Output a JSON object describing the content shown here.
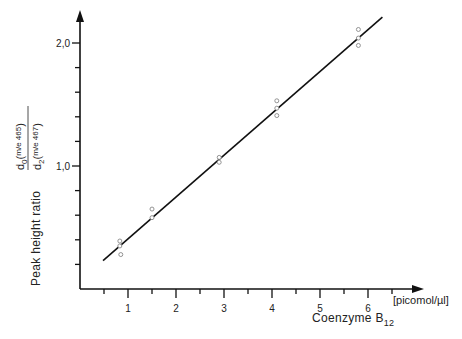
{
  "chart_data": {
    "type": "scatter",
    "title": "",
    "xlabel": "Coenzyme B12",
    "xlabel_main": "Coenzyme B",
    "xlabel_sub": "12",
    "x_unit": "[picomol/µl]",
    "ylabel": "Peak height ratio",
    "ylabel_fraction": {
      "numerator": "d0(m/e 465)",
      "denominator": "d2(m/e 467)"
    },
    "xlim": [
      0,
      6.9
    ],
    "ylim": [
      0,
      2.25
    ],
    "x_ticks": [
      1,
      2,
      3,
      4,
      5,
      6
    ],
    "x_tick_labels": [
      "1",
      "2",
      "3",
      "4",
      "5",
      "6"
    ],
    "x_minor_ticks": [
      0.5,
      1.5,
      2.5,
      3.5,
      4.5,
      5.5,
      6.5
    ],
    "y_ticks": [
      1.0,
      2.0
    ],
    "y_tick_labels": [
      "1,0",
      "2,0"
    ],
    "y_minor_ticks": [
      0.2,
      0.4,
      0.6,
      0.8,
      1.2,
      1.4,
      1.6,
      1.8
    ],
    "grid": false,
    "legend": null,
    "series": [
      {
        "name": "measurements",
        "marker": "open-circle",
        "points": [
          {
            "x": 0.83,
            "y": 0.39
          },
          {
            "x": 0.83,
            "y": 0.35
          },
          {
            "x": 0.85,
            "y": 0.28
          },
          {
            "x": 1.5,
            "y": 0.65
          },
          {
            "x": 1.5,
            "y": 0.58
          },
          {
            "x": 2.9,
            "y": 1.07
          },
          {
            "x": 2.9,
            "y": 1.03
          },
          {
            "x": 4.1,
            "y": 1.53
          },
          {
            "x": 4.1,
            "y": 1.47
          },
          {
            "x": 4.1,
            "y": 1.41
          },
          {
            "x": 5.8,
            "y": 2.11
          },
          {
            "x": 5.8,
            "y": 2.04
          },
          {
            "x": 5.8,
            "y": 1.98
          }
        ]
      },
      {
        "name": "regression line",
        "type": "line",
        "points": [
          {
            "x": 0.48,
            "y": 0.23
          },
          {
            "x": 6.3,
            "y": 2.21
          }
        ]
      }
    ]
  }
}
